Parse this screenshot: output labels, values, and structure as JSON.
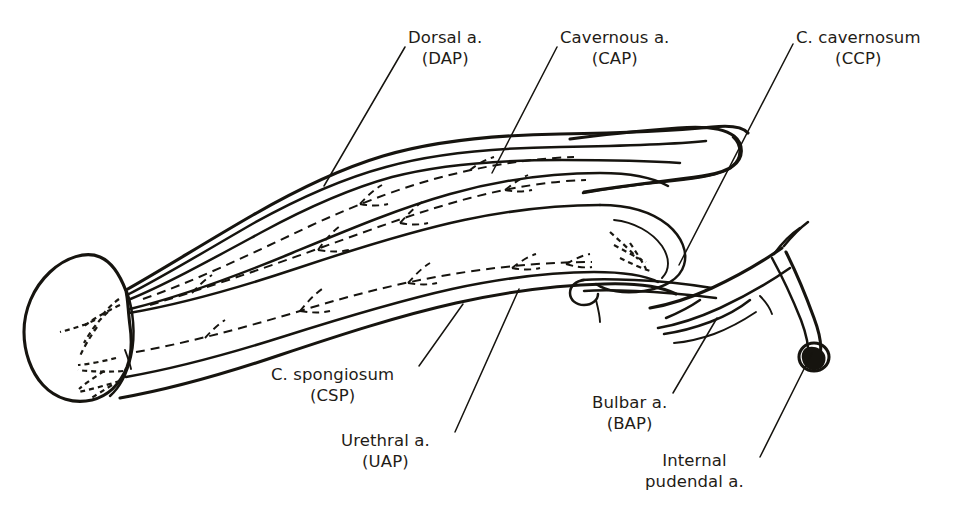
{
  "figure": {
    "background_color": "#ffffff",
    "ink_color": "#16140f",
    "width": 954,
    "height": 516
  },
  "labels": [
    {
      "id": "dorsal",
      "name": "Dorsal a.",
      "abbrev": "(DAP)",
      "leader_from": [
        405,
        47
      ],
      "leader_to": [
        324,
        186
      ]
    },
    {
      "id": "cavernous",
      "name": "Cavernous a.",
      "abbrev": "(CAP)",
      "leader_from": [
        557,
        47
      ],
      "leader_to": [
        492,
        173
      ]
    },
    {
      "id": "ccp",
      "name": "C. cavernosum",
      "abbrev": "(CCP)",
      "leader_from": [
        793,
        44
      ],
      "leader_to": [
        679,
        265
      ]
    },
    {
      "id": "spongiosum",
      "name": "C. spongiosum",
      "abbrev": "(CSP)",
      "leader_from": [
        419,
        366
      ],
      "leader_to": [
        463,
        304
      ]
    },
    {
      "id": "urethral",
      "name": "Urethral a.",
      "abbrev": "(UAP)",
      "leader_from": [
        455,
        432
      ],
      "leader_to": [
        519,
        289
      ]
    },
    {
      "id": "bulbar",
      "name": "Bulbar a.",
      "abbrev": "(BAP)",
      "leader_from": [
        673,
        393
      ],
      "leader_to": [
        717,
        318
      ]
    },
    {
      "id": "pudendal",
      "name": "Internal",
      "name_line2": "pudendal a.",
      "abbrev": "",
      "leader_from": [
        760,
        457
      ],
      "leader_to": [
        812,
        353
      ]
    }
  ],
  "structures": [
    {
      "id": "glans",
      "label": "glans penis"
    },
    {
      "id": "corpus-cavernosum",
      "label": "corpus cavernosum (CCP)"
    },
    {
      "id": "corpus-spongiosum",
      "label": "corpus spongiosum (CSP)"
    },
    {
      "id": "dorsal-artery",
      "label": "dorsal artery (DAP)",
      "style": "dashed"
    },
    {
      "id": "cavernous-artery",
      "label": "cavernous artery (CAP)",
      "style": "dashed"
    },
    {
      "id": "urethral-artery",
      "label": "urethral artery (UAP)",
      "style": "dashed"
    },
    {
      "id": "bulbar-artery",
      "label": "bulbar artery (BAP)",
      "style": "solid"
    },
    {
      "id": "internal-pudendal-artery",
      "label": "internal pudendal artery",
      "style": "solid"
    },
    {
      "id": "pudendal-cut-end",
      "label": "cut end of internal pudendal artery"
    }
  ]
}
